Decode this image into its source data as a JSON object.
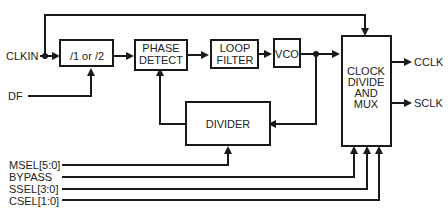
{
  "diagram": {
    "inputs": {
      "clkin": "CLKIN",
      "df": "DF",
      "msel": "MSEL[5:0]",
      "bypass": "BYPASS",
      "ssel": "SSEL[3:0]",
      "csel": "CSEL[1:0]"
    },
    "outputs": {
      "cclk": "CCLK",
      "sclk": "SCLK"
    },
    "blocks": {
      "prediv": "/1 or /2",
      "phase_detect": [
        "PHASE",
        "DETECT"
      ],
      "loop_filter": [
        "LOOP",
        "FILTER"
      ],
      "vco": "VCO",
      "divider": "DIVIDER",
      "mux": [
        "CLOCK",
        "DIVIDE",
        "AND",
        "MUX"
      ]
    }
  }
}
